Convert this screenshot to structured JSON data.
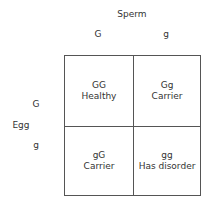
{
  "labels": {
    "sperm": "Sperm",
    "egg": "Egg",
    "sperm_alleles": [
      "G",
      "g"
    ],
    "egg_alleles": [
      "G",
      "g"
    ]
  },
  "cells": [
    {
      "genotype": "GG",
      "status": "Healthy"
    },
    {
      "genotype": "Gg",
      "status": "Carrier"
    },
    {
      "genotype": "gG",
      "status": "Carrier"
    },
    {
      "genotype": "gg",
      "status": "Has disorder"
    }
  ]
}
